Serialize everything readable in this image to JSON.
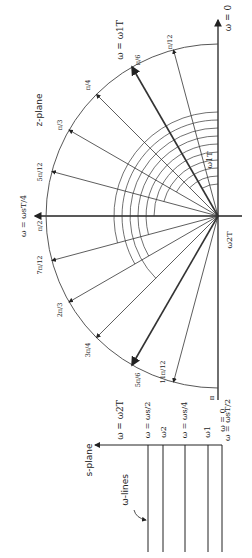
{
  "z_plane": {
    "title": "z-plane",
    "top_label": "ω = 0",
    "bottom_label": "ω = ωsT/2",
    "left_label": "ω = ωsT/4",
    "omega1_label": "ω = ω1T",
    "omega2_label": "ω = ω2T",
    "angle1_label": "ω1T",
    "angle2_label": "ω2T",
    "pi_label": "π",
    "angles": [
      {
        "label": "π/12",
        "deg": 15
      },
      {
        "label": "π/6",
        "deg": 30
      },
      {
        "label": "π/4",
        "deg": 45
      },
      {
        "label": "π/3",
        "deg": 60
      },
      {
        "label": "5π/12",
        "deg": 75
      },
      {
        "label": "π/2",
        "deg": 90
      },
      {
        "label": "7π/12",
        "deg": 105
      },
      {
        "label": "2π/3",
        "deg": 120
      },
      {
        "label": "3π/4",
        "deg": 135
      },
      {
        "label": "5π/6",
        "deg": 150
      },
      {
        "label": "11π/12",
        "deg": 165
      }
    ]
  },
  "s_plane": {
    "title": "s-plane",
    "annotation": "ω-lines",
    "lines": [
      {
        "label": "ω = ωs/2"
      },
      {
        "label": "ω2"
      },
      {
        "label": "ω = ωs/4"
      },
      {
        "label": "ω1"
      },
      {
        "label": "ω = 0"
      }
    ]
  }
}
